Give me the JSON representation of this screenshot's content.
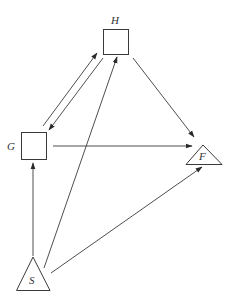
{
  "diagram": {
    "type": "directed-graph",
    "nodes": [
      {
        "id": "H",
        "label": "H",
        "shape": "square"
      },
      {
        "id": "G",
        "label": "G",
        "shape": "square"
      },
      {
        "id": "F",
        "label": "F",
        "shape": "triangle"
      },
      {
        "id": "S",
        "label": "S",
        "shape": "triangle"
      }
    ],
    "edges": [
      {
        "from": "G",
        "to": "H"
      },
      {
        "from": "H",
        "to": "G"
      },
      {
        "from": "H",
        "to": "F"
      },
      {
        "from": "G",
        "to": "F"
      },
      {
        "from": "S",
        "to": "G"
      },
      {
        "from": "S",
        "to": "H"
      },
      {
        "from": "S",
        "to": "F"
      }
    ],
    "colors": {
      "stroke": "#3a3a3a",
      "background": "#ffffff"
    }
  },
  "labels": {
    "H": "H",
    "G": "G",
    "F": "F",
    "S": "S"
  }
}
